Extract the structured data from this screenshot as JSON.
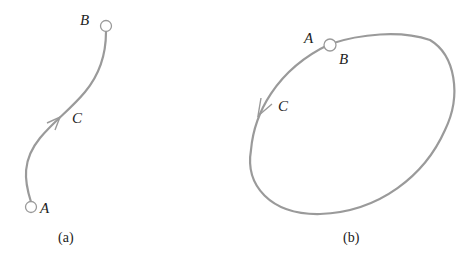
{
  "panels": [
    {
      "id": "a",
      "caption": "(a)",
      "labels": {
        "start": "A",
        "end": "B",
        "path": "C"
      },
      "path_type": "open curve from A to B with arrow toward B"
    },
    {
      "id": "b",
      "caption": "(b)",
      "labels": {
        "start": "A",
        "end": "B",
        "path": "C"
      },
      "path_type": "closed loop where A and B coincide, arrow counterclockwise"
    }
  ],
  "colors": {
    "curve": "#9a9a9a",
    "text": "#222222",
    "point_fill": "#ffffff"
  }
}
